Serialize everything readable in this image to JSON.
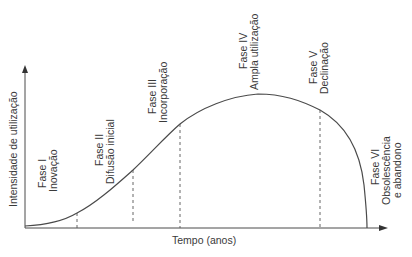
{
  "diagram": {
    "type": "technology-lifecycle-curve",
    "y_axis_label": "Intensidade de utilização",
    "x_axis_label": "Tempo (anos)",
    "phases": [
      {
        "phase": "Fase I",
        "name": "Inovação"
      },
      {
        "phase": "Fase II",
        "name": "Difusão inicial"
      },
      {
        "phase": "Fase III",
        "name": "Incorporação"
      },
      {
        "phase": "Fase IV",
        "name": "Ampla utilização"
      },
      {
        "phase": "Fase V",
        "name": "Declinação"
      },
      {
        "phase": "Fase VI",
        "name": "Obsolescência",
        "name2": "e abandono"
      }
    ],
    "colors": {
      "line": "#4a4a4a",
      "text": "#3a3a3a",
      "background": "#ffffff"
    }
  }
}
